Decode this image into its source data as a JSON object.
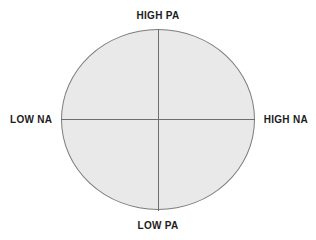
{
  "diagram": {
    "type": "circumplex",
    "title": "",
    "background_color": "#ffffff",
    "shape": {
      "name": "circle",
      "fill_color": "#e9e9e9",
      "stroke_color": "#7d7d7d"
    },
    "axes": {
      "line_color": "#6e6e6e",
      "vertical": {
        "top_label": "HIGH PA",
        "bottom_label": "LOW PA"
      },
      "horizontal": {
        "left_label": "LOW NA",
        "right_label": "HIGH NA"
      }
    },
    "labels": {
      "top": "HIGH PA",
      "bottom": "LOW PA",
      "left": "LOW NA",
      "right": "HIGH NA",
      "text_color": "#1c1c1c"
    }
  }
}
